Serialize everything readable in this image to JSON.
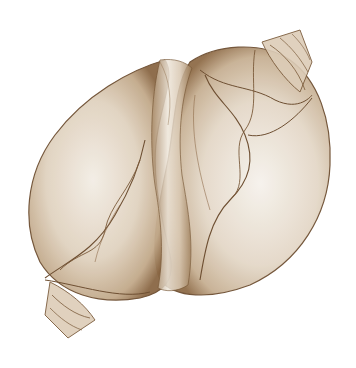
{
  "image": {
    "description": "Sepia X-ray style image of two overlapping sea shells",
    "colors": {
      "background": "#ffffff",
      "shell_light": "#f1ebe2",
      "shell_mid": "#c9b49b",
      "shell_dark": "#7a5a3a",
      "outline": "#6e4f32"
    }
  }
}
